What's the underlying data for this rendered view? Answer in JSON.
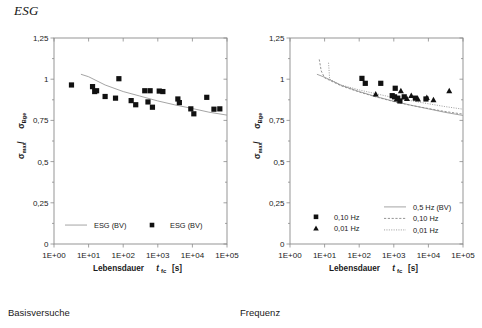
{
  "document": {
    "title": "ESG",
    "footer_left": "Basisversuche",
    "footer_right": "Frequenz"
  },
  "chart_data": [
    {
      "id": "left",
      "type": "scatter",
      "title": "",
      "xlabel": "Lebensdauer t_fc [s]",
      "xlabel_main": "Lebensdauer",
      "xlabel_var": "t",
      "xlabel_var_sub": "fc",
      "xlabel_unit": "[s]",
      "ylabel": "σmax / σBge",
      "ylabel_sym1": "σ",
      "ylabel_sub1": "max",
      "ylabel_sep": " / ",
      "ylabel_sym2": "σ",
      "ylabel_sub2": "Bge",
      "grid": false,
      "xscale": "log",
      "xlim": [
        1,
        100000
      ],
      "xticks": [
        "1E+00",
        "1E+01",
        "1E+02",
        "1E+03",
        "1E+04",
        "1E+05"
      ],
      "ylim": [
        0,
        1.25
      ],
      "yticks": [
        "0",
        "0,25",
        "0,5",
        "0,75",
        "1",
        "1,25"
      ],
      "ytick_values": [
        0,
        0.25,
        0.5,
        0.75,
        1,
        1.25
      ],
      "legend_position": "inside-bottom",
      "legend": [
        {
          "label": "ESG (BV)",
          "marker": "line",
          "style": "solid",
          "color": "#9a9a9a"
        },
        {
          "label": "ESG (BV)",
          "marker": "square",
          "style": "marker",
          "color": "#111111"
        }
      ],
      "series": [
        {
          "name": "ESG (BV)",
          "marker": "square",
          "points": [
            {
              "x": 3.2,
              "y": 0.965
            },
            {
              "x": 13.0,
              "y": 0.955
            },
            {
              "x": 15.0,
              "y": 0.925
            },
            {
              "x": 17.0,
              "y": 0.93
            },
            {
              "x": 30.0,
              "y": 0.895
            },
            {
              "x": 75.0,
              "y": 1.003
            },
            {
              "x": 60.0,
              "y": 0.885
            },
            {
              "x": 170.0,
              "y": 0.87
            },
            {
              "x": 230.0,
              "y": 0.845
            },
            {
              "x": 420.0,
              "y": 0.93
            },
            {
              "x": 600.0,
              "y": 0.93
            },
            {
              "x": 520.0,
              "y": 0.862
            },
            {
              "x": 700.0,
              "y": 0.83
            },
            {
              "x": 1100.0,
              "y": 0.928
            },
            {
              "x": 1400.0,
              "y": 0.925
            },
            {
              "x": 3800.0,
              "y": 0.88
            },
            {
              "x": 4200.0,
              "y": 0.858
            },
            {
              "x": 9000.0,
              "y": 0.82
            },
            {
              "x": 11000.0,
              "y": 0.79
            },
            {
              "x": 26000.0,
              "y": 0.89
            },
            {
              "x": 42000.0,
              "y": 0.818
            },
            {
              "x": 62000.0,
              "y": 0.82
            }
          ]
        }
      ],
      "fit_curves": [
        {
          "name": "ESG (BV)",
          "style": "solid",
          "color": "#9a9a9a",
          "points": [
            [
              6,
              1.03
            ],
            [
              10,
              1.015
            ],
            [
              30,
              0.965
            ],
            [
              100,
              0.925
            ],
            [
              300,
              0.898
            ],
            [
              1000,
              0.868
            ],
            [
              3000,
              0.845
            ],
            [
              10000,
              0.822
            ],
            [
              30000,
              0.8
            ],
            [
              100000,
              0.782
            ]
          ]
        }
      ]
    },
    {
      "id": "right",
      "type": "scatter",
      "title": "",
      "xlabel": "Lebensdauer t_fc [s]",
      "xlabel_main": "Lebensdauer",
      "xlabel_var": "t",
      "xlabel_var_sub": "fc",
      "xlabel_unit": "[s]",
      "ylabel": "σmax / σBge",
      "ylabel_sym1": "σ",
      "ylabel_sub1": "max",
      "ylabel_sep": " / ",
      "ylabel_sym2": "σ",
      "ylabel_sub2": "Bge",
      "grid": false,
      "xscale": "log",
      "xlim": [
        1,
        100000
      ],
      "xticks": [
        "1E+00",
        "1E+01",
        "1E+02",
        "1E+03",
        "1E+04",
        "1E+05"
      ],
      "ylim": [
        0,
        1.25
      ],
      "yticks": [
        "0",
        "0,25",
        "0,5",
        "0,75",
        "1",
        "1,25"
      ],
      "ytick_values": [
        0,
        0.25,
        0.5,
        0.75,
        1,
        1.25
      ],
      "legend_position": "inside-bottom",
      "legend_left": [
        {
          "label": "0,10 Hz",
          "marker": "square",
          "style": "marker",
          "color": "#111111"
        },
        {
          "label": "0,01 Hz",
          "marker": "triangle",
          "style": "marker",
          "color": "#111111"
        }
      ],
      "legend_right": [
        {
          "label": "0,5 Hz (BV)",
          "marker": "line",
          "style": "solid",
          "color": "#9a9a9a"
        },
        {
          "label": "0,10 Hz",
          "marker": "line",
          "style": "dashed",
          "color": "#8a8a8a"
        },
        {
          "label": "0,01 Hz",
          "marker": "line",
          "style": "dotted",
          "color": "#9a9a9a"
        }
      ],
      "series": [
        {
          "name": "0,10 Hz",
          "marker": "square",
          "points": [
            {
              "x": 120.0,
              "y": 1.005
            },
            {
              "x": 150.0,
              "y": 0.975
            },
            {
              "x": 420.0,
              "y": 0.975
            },
            {
              "x": 1100.0,
              "y": 0.945
            },
            {
              "x": 900.0,
              "y": 0.9
            },
            {
              "x": 1050.0,
              "y": 0.893
            },
            {
              "x": 1300.0,
              "y": 0.885
            },
            {
              "x": 1500.0,
              "y": 0.868
            },
            {
              "x": 2000.0,
              "y": 0.893
            },
            {
              "x": 4200.0,
              "y": 0.885
            },
            {
              "x": 8500.0,
              "y": 0.88
            }
          ]
        },
        {
          "name": "0,01 Hz",
          "marker": "triangle",
          "points": [
            {
              "x": 300.0,
              "y": 0.91
            },
            {
              "x": 1200.0,
              "y": 0.88
            },
            {
              "x": 1600.0,
              "y": 0.93
            },
            {
              "x": 2400.0,
              "y": 0.882
            },
            {
              "x": 3200.0,
              "y": 0.9
            },
            {
              "x": 5000.0,
              "y": 0.88
            },
            {
              "x": 9000.0,
              "y": 0.888
            },
            {
              "x": 14000.0,
              "y": 0.875
            },
            {
              "x": 40000.0,
              "y": 0.93
            }
          ]
        }
      ],
      "fit_curves": [
        {
          "name": "0,5 Hz (BV)",
          "style": "solid",
          "color": "#9a9a9a",
          "points": [
            [
              6,
              1.03
            ],
            [
              10,
              1.012
            ],
            [
              30,
              0.963
            ],
            [
              100,
              0.925
            ],
            [
              300,
              0.895
            ],
            [
              1000,
              0.866
            ],
            [
              3000,
              0.843
            ],
            [
              10000,
              0.82
            ],
            [
              30000,
              0.799
            ],
            [
              100000,
              0.78
            ]
          ]
        },
        {
          "name": "0,10 Hz",
          "style": "dashed",
          "color": "#8a8a8a",
          "points": [
            [
              7,
              1.12
            ],
            [
              8,
              1.05
            ],
            [
              10,
              1.008
            ],
            [
              30,
              0.96
            ],
            [
              100,
              0.922
            ],
            [
              300,
              0.893
            ],
            [
              1000,
              0.864
            ],
            [
              3000,
              0.842
            ],
            [
              10000,
              0.822
            ],
            [
              30000,
              0.804
            ],
            [
              100000,
              0.788
            ]
          ]
        },
        {
          "name": "0,01 Hz",
          "style": "dotted",
          "color": "#9a9a9a",
          "points": [
            [
              13,
              1.1
            ],
            [
              14,
              1.0
            ],
            [
              30,
              0.965
            ],
            [
              100,
              0.935
            ],
            [
              300,
              0.912
            ],
            [
              1000,
              0.888
            ],
            [
              3000,
              0.87
            ],
            [
              10000,
              0.851
            ],
            [
              30000,
              0.834
            ],
            [
              100000,
              0.818
            ]
          ]
        }
      ]
    }
  ]
}
